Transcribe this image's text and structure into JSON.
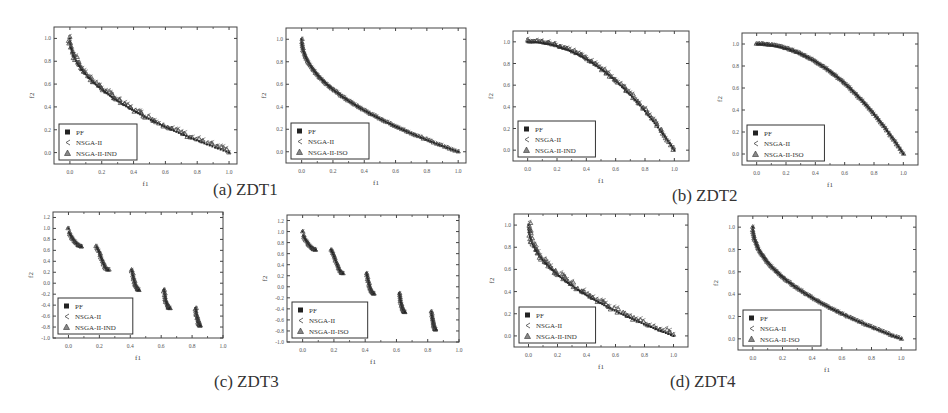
{
  "figure": {
    "captions": {
      "a": "(a) ZDT1",
      "b": "(b) ZDT2",
      "c": "(c) ZDT3",
      "d": "(d) ZDT4"
    }
  },
  "chart_data": [
    {
      "id": "zdt1-ind",
      "group": "a",
      "type": "scatter",
      "xlabel": "f1",
      "ylabel": "f2",
      "xlim": [
        -0.1,
        1.05
      ],
      "ylim": [
        -0.1,
        1.1
      ],
      "xticks": [
        "0.0",
        "0.2",
        "0.4",
        "0.6",
        "0.8",
        "1.0"
      ],
      "yticks": [
        "0.0",
        "0.2",
        "0.4",
        "0.6",
        "0.8",
        "1.0"
      ],
      "legend": [
        "PF",
        "NSGA-II",
        "NSGA-II-IND"
      ],
      "legend_position": "lower left",
      "front": "zdt1",
      "spread": 0.025
    },
    {
      "id": "zdt1-iso",
      "group": "a",
      "type": "scatter",
      "xlabel": "f1",
      "ylabel": "f2",
      "xlim": [
        -0.1,
        1.05
      ],
      "ylim": [
        -0.1,
        1.1
      ],
      "xticks": [
        "0.0",
        "0.2",
        "0.4",
        "0.6",
        "0.8",
        "1.0"
      ],
      "yticks": [
        "0.0",
        "0.2",
        "0.4",
        "0.6",
        "0.8",
        "1.0"
      ],
      "legend": [
        "PF",
        "NSGA-II",
        "NSGA-II-ISO"
      ],
      "legend_position": "lower left",
      "front": "zdt1",
      "spread": 0.006
    },
    {
      "id": "zdt2-ind",
      "group": "b",
      "type": "scatter",
      "xlabel": "f1",
      "ylabel": "f2",
      "xlim": [
        -0.1,
        1.1
      ],
      "ylim": [
        -0.1,
        1.1
      ],
      "xticks": [
        "0.0",
        "0.2",
        "0.4",
        "0.6",
        "0.8",
        "1.0"
      ],
      "yticks": [
        "0.0",
        "0.2",
        "0.4",
        "0.6",
        "0.8",
        "1.0"
      ],
      "legend": [
        "PF",
        "NSGA-II",
        "NSGA-II-IND"
      ],
      "legend_position": "lower left",
      "front": "zdt2",
      "spread": 0.02
    },
    {
      "id": "zdt2-iso",
      "group": "b",
      "type": "scatter",
      "xlabel": "f1",
      "ylabel": "f2",
      "xlim": [
        -0.1,
        1.1
      ],
      "ylim": [
        -0.1,
        1.1
      ],
      "xticks": [
        "0.0",
        "0.2",
        "0.4",
        "0.6",
        "0.8",
        "1.0"
      ],
      "yticks": [
        "0.0",
        "0.2",
        "0.4",
        "0.6",
        "0.8",
        "1.0"
      ],
      "legend": [
        "PF",
        "NSGA-II",
        "NSGA-II-ISO"
      ],
      "legend_position": "lower left",
      "front": "zdt2",
      "spread": 0.006
    },
    {
      "id": "zdt3-ind",
      "group": "c",
      "type": "scatter",
      "xlabel": "f1",
      "ylabel": "f2",
      "xlim": [
        -0.1,
        1.0
      ],
      "ylim": [
        -1.0,
        1.3
      ],
      "xticks": [
        "0.0",
        "0.2",
        "0.4",
        "0.6",
        "0.8",
        "1.0"
      ],
      "yticks": [
        "-1.0",
        "-0.8",
        "-0.6",
        "-0.4",
        "-0.2",
        "0.0",
        "0.2",
        "0.4",
        "0.6",
        "0.8",
        "1.0",
        "1.2"
      ],
      "legend": [
        "PF",
        "NSGA-II",
        "NSGA-II-IND"
      ],
      "legend_position": "lower left",
      "front": "zdt3",
      "spread": 0.01
    },
    {
      "id": "zdt3-iso",
      "group": "c",
      "type": "scatter",
      "xlabel": "f1",
      "ylabel": "f2",
      "xlim": [
        -0.1,
        1.0
      ],
      "ylim": [
        -1.0,
        1.3
      ],
      "xticks": [
        "0.0",
        "0.2",
        "0.4",
        "0.6",
        "0.8",
        "1.0"
      ],
      "yticks": [
        "-1.0",
        "-0.8",
        "-0.6",
        "-0.4",
        "-0.2",
        "0.0",
        "0.2",
        "0.4",
        "0.6",
        "0.8",
        "1.0",
        "1.2"
      ],
      "legend": [
        "PF",
        "NSGA-II",
        "NSGA-II-ISO"
      ],
      "legend_position": "lower left",
      "front": "zdt3",
      "spread": 0.006
    },
    {
      "id": "zdt4-ind",
      "group": "d",
      "type": "scatter",
      "xlabel": "f1",
      "ylabel": "f2",
      "xlim": [
        -0.1,
        1.1
      ],
      "ylim": [
        -0.1,
        1.1
      ],
      "xticks": [
        "0.0",
        "0.2",
        "0.4",
        "0.6",
        "0.8",
        "1.0"
      ],
      "yticks": [
        "0.0",
        "0.2",
        "0.4",
        "0.6",
        "0.8",
        "1.0"
      ],
      "legend": [
        "PF",
        "NSGA-II",
        "NSGA-II-IND"
      ],
      "legend_position": "lower left",
      "front": "zdt1",
      "spread": 0.03
    },
    {
      "id": "zdt4-iso",
      "group": "d",
      "type": "scatter",
      "xlabel": "f1",
      "ylabel": "f2",
      "xlim": [
        -0.1,
        1.1
      ],
      "ylim": [
        -0.1,
        1.1
      ],
      "xticks": [
        "0.0",
        "0.2",
        "0.4",
        "0.6",
        "0.8",
        "1.0"
      ],
      "yticks": [
        "0.0",
        "0.2",
        "0.4",
        "0.6",
        "0.8",
        "1.0"
      ],
      "legend": [
        "PF",
        "NSGA-II",
        "NSGA-II-ISO"
      ],
      "legend_position": "lower left",
      "front": "zdt1",
      "spread": 0.006
    }
  ],
  "layout": {
    "panels": [
      {
        "chart": 0,
        "x": 54,
        "y": 27,
        "w": 183,
        "h": 137
      },
      {
        "chart": 1,
        "x": 286,
        "y": 28,
        "w": 180,
        "h": 135
      },
      {
        "chart": 2,
        "x": 513,
        "y": 31,
        "w": 176,
        "h": 130
      },
      {
        "chart": 3,
        "x": 742,
        "y": 33,
        "w": 176,
        "h": 132
      },
      {
        "chart": 4,
        "x": 53,
        "y": 212,
        "w": 170,
        "h": 126
      },
      {
        "chart": 5,
        "x": 287,
        "y": 215,
        "w": 172,
        "h": 127
      },
      {
        "chart": 6,
        "x": 514,
        "y": 214,
        "w": 174,
        "h": 133
      },
      {
        "chart": 7,
        "x": 738,
        "y": 216,
        "w": 178,
        "h": 134
      }
    ],
    "captions": [
      {
        "key": "a",
        "x": 213,
        "y": 180
      },
      {
        "key": "b",
        "x": 672,
        "y": 186
      },
      {
        "key": "c",
        "x": 214,
        "y": 372
      },
      {
        "key": "d",
        "x": 670,
        "y": 372
      }
    ]
  }
}
